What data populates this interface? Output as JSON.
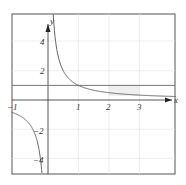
{
  "chart_data": {
    "type": "line",
    "title": "",
    "xlabel": "x",
    "ylabel": "y",
    "xlim": [
      -1.2,
      4.2
    ],
    "ylim": [
      -5,
      5.8
    ],
    "grid": true,
    "x_ticks": [
      "-1",
      "1",
      "2",
      "3"
    ],
    "y_ticks": [
      "4",
      "2",
      "-2",
      "-4"
    ],
    "series": [
      {
        "name": "y = 1/x",
        "function": "1/x",
        "color": "#555555"
      },
      {
        "name": "y = 1",
        "function": "1",
        "color": "#555555"
      }
    ],
    "annotations": [
      {
        "type": "rect",
        "x": [
          2,
          3
        ],
        "y": [
          0.333,
          1
        ],
        "fill": "#e8e8e8"
      }
    ]
  },
  "labels": {
    "x_axis": "x",
    "y_axis": "y",
    "tick_x_neg1": "−1",
    "tick_x_1": "1",
    "tick_x_2": "2",
    "tick_x_3": "3",
    "tick_y_4": "4",
    "tick_y_2": "2",
    "tick_y_neg2": "−2",
    "tick_y_neg4": "−4"
  }
}
